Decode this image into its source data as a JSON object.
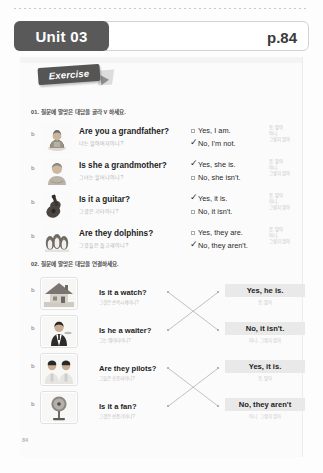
{
  "header": {
    "unit_label": "Unit 03",
    "page_label": "p.84"
  },
  "exercise_tag": "Exercise",
  "section1": {
    "title": "01. 질문에 알맞은 대답을 골라 V 하세요.",
    "rows": [
      {
        "bullet": "b",
        "image": "elderly-man-photo",
        "question_en": "Are you a grandfather?",
        "question_ko": "너는 할아버지이니?",
        "answers": [
          {
            "text": "Yes, I am.",
            "checked": false
          },
          {
            "text": "No, I'm not.",
            "checked": true
          }
        ],
        "gloss": [
          "응, 맞아",
          "아니,",
          "그렇지 않아"
        ]
      },
      {
        "bullet": "b",
        "image": "elderly-woman-photo",
        "question_en": "Is she a grandmother?",
        "question_ko": "그녀는 할머니이니?",
        "answers": [
          {
            "text": "Yes, she is.",
            "checked": true
          },
          {
            "text": "No, she isn't.",
            "checked": false
          }
        ],
        "gloss": [
          "응, 맞아",
          "아니,",
          "그렇지 않아"
        ]
      },
      {
        "bullet": "b",
        "image": "guitar-photo",
        "question_en": "Is it a guitar?",
        "question_ko": "그것은 기타이니?",
        "answers": [
          {
            "text": "Yes, it is.",
            "checked": true
          },
          {
            "text": "No, it isn't.",
            "checked": false
          }
        ],
        "gloss": [
          "응, 맞아",
          "아니,",
          "그렇지 않아"
        ]
      },
      {
        "bullet": "b",
        "image": "penguins-photo",
        "question_en": "Are they dolphins?",
        "question_ko": "그것들은 돌고래이니?",
        "answers": [
          {
            "text": "Yes, they are.",
            "checked": false
          },
          {
            "text": "No, they aren't.",
            "checked": true
          }
        ],
        "gloss": [
          "응, 맞아",
          "아니,",
          "그렇지 않아"
        ]
      }
    ]
  },
  "section2": {
    "title": "02. 질문에 알맞은 대답을 연결하세요.",
    "rows": [
      {
        "bullet": "b",
        "image": "house-photo",
        "question_en": "Is it a watch?",
        "question_ko": "그것은 손목시계이니?"
      },
      {
        "bullet": "b",
        "image": "waiter-photo",
        "question_en": "Is he a waiter?",
        "question_ko": "그는 웨이터이니?"
      },
      {
        "bullet": "b",
        "image": "pilots-photo",
        "question_en": "Are they pilots?",
        "question_ko": "그들은 조종사이니?"
      },
      {
        "bullet": "b",
        "image": "fan-photo",
        "question_en": "Is it a fan?",
        "question_ko": "그것은 선풍기이니?"
      }
    ],
    "answers": [
      {
        "text": "Yes, he is.",
        "gloss": "응, 맞아"
      },
      {
        "text": "No, it isn't.",
        "gloss": "아니, 그렇지 않아"
      },
      {
        "text": "Yes, it is.",
        "gloss": "응, 맞아"
      },
      {
        "text": "No, they aren't",
        "gloss": "아니, 그렇지 않아"
      }
    ],
    "connections": [
      {
        "from": 0,
        "to": 1
      },
      {
        "from": 1,
        "to": 0
      },
      {
        "from": 2,
        "to": 3
      },
      {
        "from": 3,
        "to": 2
      }
    ]
  },
  "footer": {
    "page_number": "84"
  },
  "colors": {
    "unit_tag_bg": "#595959",
    "answer_box_bg": "#e9e9e9",
    "gloss_text": "#c2c2c2"
  }
}
